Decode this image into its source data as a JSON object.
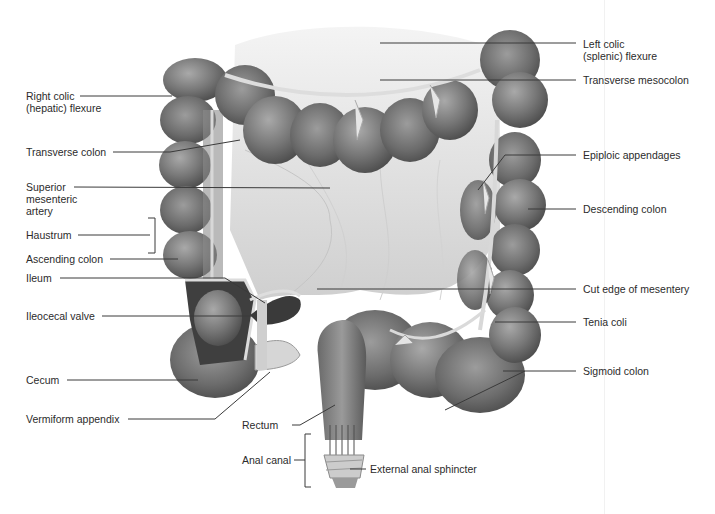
{
  "figure": {
    "colors": {
      "background": "#ffffff",
      "tissue": "#7a7a7a",
      "tissue_dark": "#4f4f4f",
      "tissue_light": "#b5b5b5",
      "mesentery": "#d9d9d9",
      "leader_line": "#3a3a3a",
      "text": "#2b2b2b"
    }
  },
  "labels": {
    "left": [
      {
        "id": "right-colic-flexure",
        "text": "Right colic\n(hepatic) flexure"
      },
      {
        "id": "transverse-colon",
        "text": "Transverse colon"
      },
      {
        "id": "superior-mesenteric-artery",
        "text": "Superior\nmesenteric\nartery"
      },
      {
        "id": "haustrum",
        "text": "Haustrum"
      },
      {
        "id": "ascending-colon",
        "text": "Ascending colon"
      },
      {
        "id": "ileum",
        "text": "Ileum"
      },
      {
        "id": "ileocecal-valve",
        "text": "Ileocecal valve"
      },
      {
        "id": "cecum",
        "text": "Cecum"
      },
      {
        "id": "vermiform-appendix",
        "text": "Vermiform appendix"
      }
    ],
    "right": [
      {
        "id": "left-colic-flexure",
        "text": "Left colic\n(splenic) flexure"
      },
      {
        "id": "transverse-mesocolon",
        "text": "Transverse mesocolon"
      },
      {
        "id": "epiploic-appendages",
        "text": "Epiploic appendages"
      },
      {
        "id": "descending-colon",
        "text": "Descending colon"
      },
      {
        "id": "cut-edge-of-mesentery",
        "text": "Cut edge of mesentery"
      },
      {
        "id": "tenia-coli",
        "text": "Tenia coli"
      },
      {
        "id": "sigmoid-colon",
        "text": "Sigmoid colon"
      }
    ],
    "bottom": [
      {
        "id": "rectum",
        "text": "Rectum"
      },
      {
        "id": "anal-canal",
        "text": "Anal canal"
      },
      {
        "id": "external-anal-sphincter",
        "text": "External anal sphincter"
      }
    ]
  }
}
